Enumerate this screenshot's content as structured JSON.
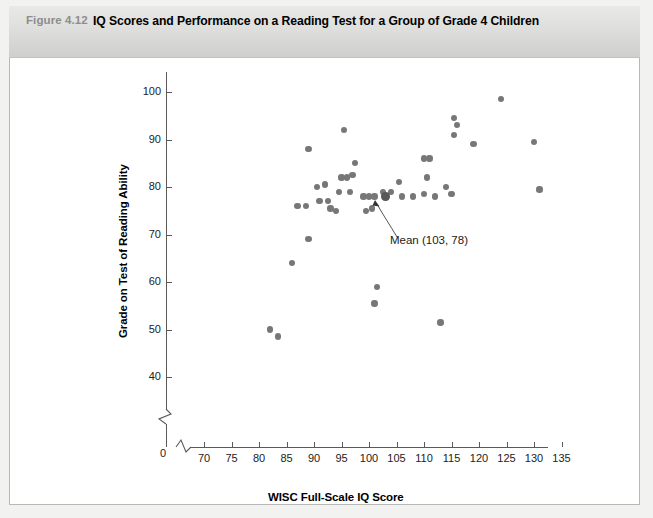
{
  "figure": {
    "number": "Figure 4.12",
    "title": "IQ Scores and Performance on a Reading Test for a Group of Grade 4 Children"
  },
  "chart_data": {
    "type": "scatter",
    "title": "IQ Scores and Performance on a Reading Test for a Group of Grade 4 Children",
    "xlabel": "WISC Full-Scale IQ Score",
    "ylabel": "Grade on Test of Reading Ability",
    "xlim": [
      68,
      137
    ],
    "ylim": [
      38,
      103
    ],
    "x_ticks": [
      70,
      75,
      80,
      85,
      90,
      95,
      100,
      105,
      110,
      115,
      120,
      125,
      130,
      135
    ],
    "y_ticks": [
      40,
      50,
      60,
      70,
      80,
      90,
      100
    ],
    "axis_break_x": true,
    "axis_break_y": true,
    "origin_label": "0",
    "grid": false,
    "legend": "none",
    "marker_color": "#777777",
    "mean_marker_color": "#595959",
    "points": [
      [
        82,
        50
      ],
      [
        83.5,
        48.5
      ],
      [
        86,
        64
      ],
      [
        89,
        69
      ],
      [
        87,
        76
      ],
      [
        88.5,
        76
      ],
      [
        89,
        88
      ],
      [
        90.5,
        80
      ],
      [
        92,
        80.5
      ],
      [
        91,
        77
      ],
      [
        92.5,
        77
      ],
      [
        93,
        75.5
      ],
      [
        94,
        75
      ],
      [
        95,
        82
      ],
      [
        96,
        82
      ],
      [
        94.5,
        79
      ],
      [
        96.5,
        79
      ],
      [
        95.5,
        92
      ],
      [
        97.5,
        85
      ],
      [
        97,
        82.5
      ],
      [
        99,
        78
      ],
      [
        100,
        78
      ],
      [
        101,
        78
      ],
      [
        99.5,
        75
      ],
      [
        100.5,
        75.5
      ],
      [
        101.5,
        59
      ],
      [
        101,
        55.5
      ],
      [
        102.5,
        79
      ],
      [
        103,
        78
      ],
      [
        104,
        79
      ],
      [
        106,
        78
      ],
      [
        105.5,
        81
      ],
      [
        108,
        78
      ],
      [
        110,
        86
      ],
      [
        111,
        86
      ],
      [
        110.5,
        82
      ],
      [
        110,
        78.5
      ],
      [
        112,
        78
      ],
      [
        113,
        51.5
      ],
      [
        114,
        80
      ],
      [
        115,
        78.5
      ],
      [
        115.5,
        94.5
      ],
      [
        116,
        93
      ],
      [
        115.5,
        91
      ],
      [
        119,
        89
      ],
      [
        124,
        98.5
      ],
      [
        130,
        89.5
      ],
      [
        131,
        79.5
      ]
    ],
    "mean_point": {
      "x": 103,
      "y": 78,
      "label": "Mean (103, 78)"
    }
  },
  "annotation": {
    "label": "Mean (103, 78)"
  }
}
